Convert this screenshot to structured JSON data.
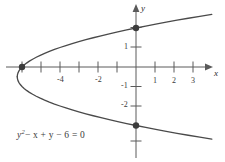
{
  "figure": {
    "title": "",
    "equation_text": "y² − x + y − 6 = 0",
    "equation_parts": {
      "y": "y",
      "exp": "2",
      "minus_x": "− x",
      "plus_y": "+ y",
      "minus_6": "− 6",
      "equals_0": "= 0"
    },
    "axis_labels": {
      "x": "x",
      "y": "y"
    },
    "colors": {
      "curve": "#4a4a4a",
      "axis": "#5a5a5a",
      "point": "#3c3c3c",
      "text": "#3a3a3a",
      "background": "#ffffff"
    }
  },
  "chart_data": {
    "type": "line",
    "title": "",
    "subtitle": "",
    "xlabel": "x",
    "ylabel": "y",
    "equation": "y^2 - x + y - 6 = 0",
    "solved_form": "x = y^2 + y - 6",
    "curve_kind": "parabola opening right",
    "vertex": [
      -6.25,
      -0.5
    ],
    "grid": false,
    "legend": null,
    "xlim": [
      -7.2,
      3.9
    ],
    "ylim": [
      -3.9,
      2.9
    ],
    "xticks": [
      -6,
      -5,
      -4,
      -3,
      -2,
      -1,
      1,
      2,
      3
    ],
    "xtick_labels": [
      "",
      "",
      "-4",
      "",
      "-2",
      "",
      "1",
      "2",
      "3"
    ],
    "yticks": [
      2,
      1,
      -1,
      -2,
      -3
    ],
    "ytick_labels": [
      "",
      "1",
      "-1",
      "-2",
      ""
    ],
    "marked_points": [
      {
        "label": "x-intercept",
        "x": -6,
        "y": 0
      },
      {
        "label": "y-intercept-upper",
        "x": 0,
        "y": 2
      },
      {
        "label": "y-intercept-lower",
        "x": 0,
        "y": -3
      }
    ],
    "series": [
      {
        "name": "y^2 - x + y - 6 = 0",
        "x": [
          -6.25,
          -6.24,
          -6.21,
          -6.16,
          -6.09,
          -6.0,
          -5.89,
          -5.76,
          -5.61,
          -5.44,
          -5.25,
          -5.04,
          -4.81,
          -4.56,
          -4.29,
          -4.0,
          -3.69,
          -3.36,
          -3.01,
          -2.64,
          -2.25,
          -1.84,
          -1.41,
          -0.96,
          -0.49,
          0.0,
          0.51,
          1.04,
          1.59,
          2.16,
          2.75,
          3.36,
          3.99
        ],
        "y": [
          -0.5,
          -0.4,
          -0.3,
          -0.2,
          -0.1,
          0.0,
          0.1,
          0.2,
          0.3,
          0.4,
          0.5,
          0.6,
          0.7,
          0.8,
          0.9,
          1.0,
          1.1,
          1.2,
          1.3,
          1.4,
          1.5,
          1.6,
          1.7,
          1.8,
          1.9,
          2.0,
          2.1,
          2.2,
          2.3,
          2.4,
          2.5,
          2.6,
          2.7
        ]
      },
      {
        "name": "lower branch",
        "x": [
          -6.25,
          -6.24,
          -6.21,
          -6.16,
          -6.09,
          -6.0,
          -5.89,
          -5.76,
          -5.61,
          -5.44,
          -5.25,
          -5.04,
          -4.81,
          -4.56,
          -4.29,
          -4.0,
          -3.69,
          -3.36,
          -3.01,
          -2.64,
          -2.25,
          -1.84,
          -1.41,
          -0.96,
          -0.49,
          0.0,
          0.51,
          1.04,
          1.59,
          2.16,
          2.75,
          3.36,
          3.99
        ],
        "y": [
          -0.5,
          -0.6,
          -0.7,
          -0.8,
          -0.9,
          -1.0,
          -1.1,
          -1.2,
          -1.3,
          -1.4,
          -1.5,
          -1.6,
          -1.7,
          -1.8,
          -1.9,
          -2.0,
          -2.1,
          -2.2,
          -2.3,
          -2.4,
          -2.5,
          -2.6,
          -2.7,
          -2.8,
          -2.9,
          -3.0,
          -3.1,
          -3.2,
          -3.3,
          -3.4,
          -3.5,
          -3.6,
          -3.7
        ]
      }
    ]
  }
}
